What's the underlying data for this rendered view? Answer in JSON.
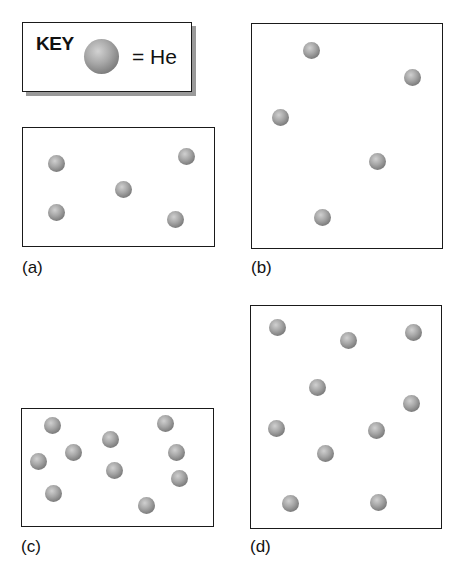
{
  "key": {
    "title": "KEY",
    "symbol": "sphere",
    "equals_label": "= He"
  },
  "panels": [
    {
      "id": "a",
      "label": "(a)",
      "box": {
        "x": 22,
        "y": 127,
        "w": 191,
        "h": 118
      },
      "atoms": [
        [
          56,
          163
        ],
        [
          186,
          156
        ],
        [
          123,
          189
        ],
        [
          56,
          212
        ],
        [
          175,
          219
        ]
      ]
    },
    {
      "id": "b",
      "label": "(b)",
      "box": {
        "x": 251,
        "y": 23,
        "w": 190,
        "h": 224
      },
      "atoms": [
        [
          311,
          50
        ],
        [
          412,
          77
        ],
        [
          280,
          117
        ],
        [
          377,
          161
        ],
        [
          322,
          217
        ]
      ]
    },
    {
      "id": "c",
      "label": "(c)",
      "box": {
        "x": 21,
        "y": 408,
        "w": 191,
        "h": 117
      },
      "atoms": [
        [
          52,
          425
        ],
        [
          165,
          423
        ],
        [
          110,
          439
        ],
        [
          73,
          452
        ],
        [
          38,
          461
        ],
        [
          176,
          452
        ],
        [
          114,
          470
        ],
        [
          179,
          478
        ],
        [
          53,
          493
        ],
        [
          146,
          505
        ]
      ]
    },
    {
      "id": "d",
      "label": "(d)",
      "box": {
        "x": 250,
        "y": 305,
        "w": 190,
        "h": 222
      },
      "atoms": [
        [
          277,
          327
        ],
        [
          348,
          340
        ],
        [
          413,
          332
        ],
        [
          317,
          387
        ],
        [
          411,
          403
        ],
        [
          276,
          428
        ],
        [
          376,
          430
        ],
        [
          325,
          453
        ],
        [
          290,
          503
        ],
        [
          378,
          502
        ]
      ]
    }
  ],
  "labels_pos": {
    "a": [
      22,
      258
    ],
    "b": [
      251,
      258
    ],
    "c": [
      21,
      537
    ],
    "d": [
      250,
      537
    ]
  }
}
